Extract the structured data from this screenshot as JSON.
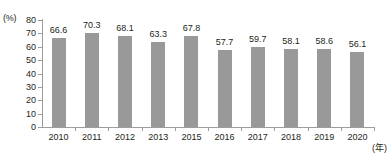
{
  "chart_data": {
    "type": "bar",
    "title": "",
    "xlabel": "(年)",
    "ylabel": "(%)",
    "categories": [
      "2010",
      "2011",
      "2012",
      "2013",
      "2015",
      "2016",
      "2017",
      "2018",
      "2019",
      "2020"
    ],
    "values": [
      66.6,
      70.3,
      68.1,
      63.3,
      67.8,
      57.7,
      59.7,
      58.1,
      58.6,
      56.1
    ],
    "value_labels": [
      "66.6",
      "70.3",
      "68.1",
      "63.3",
      "67.8",
      "57.7",
      "59.7",
      "58.1",
      "58.6",
      "56.1"
    ],
    "ylim": [
      0,
      80
    ],
    "ytick_values": [
      0,
      10,
      20,
      30,
      40,
      50,
      60,
      70,
      80
    ],
    "ytick_labels": [
      "0",
      "10",
      "20",
      "30",
      "40",
      "50",
      "60",
      "70",
      "80"
    ],
    "grid": false,
    "legend": null,
    "bar_color": "#999999",
    "axis_color": "#9d9d9d",
    "text_color": "#231f20",
    "background": "#ffffff"
  },
  "axes": {
    "y_unit": "(%)",
    "x_unit": "(年)"
  }
}
